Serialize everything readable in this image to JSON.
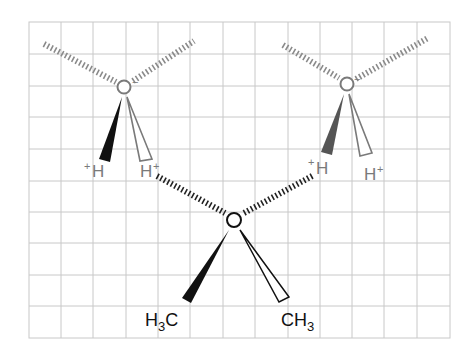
{
  "diagram": {
    "type": "hydrogen-bonding-schematic",
    "colors": {
      "grid": "#c8c8c8",
      "water": "#7a7a7a",
      "water_solid_wedge_left": "#111111",
      "water_solid_wedge_right": "#555555",
      "ether": "#111111",
      "hbond": "#222222",
      "water_hash": "#8a8a8a"
    },
    "grid": {
      "x0": 29,
      "y0": 22,
      "cols": 13,
      "rows": 10,
      "cell_w": 32.4,
      "cell_h": 31.6
    },
    "molecules": {
      "water_left": {
        "oxygen": {
          "label": "O",
          "charge": "−",
          "x": 124,
          "y": 87
        },
        "h_left": {
          "label": "H",
          "charge": "+"
        },
        "h_right": {
          "label": "H",
          "charge": "+"
        }
      },
      "water_right": {
        "oxygen": {
          "label": "O",
          "charge": "−",
          "x": 347,
          "y": 84
        },
        "h_left": {
          "label": "H",
          "charge": "+"
        },
        "h_right": {
          "label": "H",
          "charge": "+"
        }
      },
      "dimethyl_ether": {
        "oxygen": {
          "label": "O",
          "x": 234,
          "y": 220
        },
        "methyl_left": {
          "label_main": "H",
          "label_sub": "3",
          "label_tail": "C"
        },
        "methyl_right": {
          "label_main": "CH",
          "label_sub": "3"
        }
      }
    },
    "hydrogen_bonds": [
      {
        "from": "water_left.h_right",
        "to": "dimethyl_ether.oxygen"
      },
      {
        "from": "water_right.h_left",
        "to": "dimethyl_ether.oxygen"
      }
    ]
  }
}
